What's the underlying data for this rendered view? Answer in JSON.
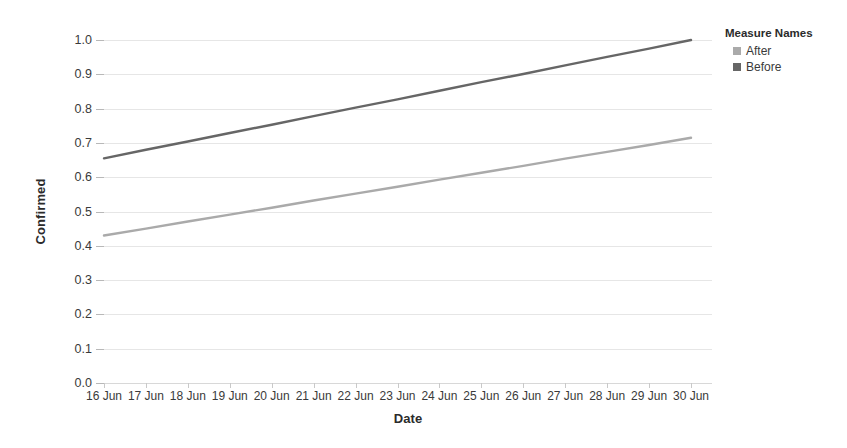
{
  "chart_data": {
    "type": "line",
    "title": "",
    "xlabel": "Date",
    "ylabel": "Confirmed",
    "x": [
      "16 Jun",
      "17 Jun",
      "18 Jun",
      "19 Jun",
      "20 Jun",
      "21 Jun",
      "22 Jun",
      "23 Jun",
      "24 Jun",
      "25 Jun",
      "26 Jun",
      "27 Jun",
      "28 Jun",
      "29 Jun",
      "30 Jun"
    ],
    "xlim": [
      "16 Jun",
      "30 Jun"
    ],
    "ylim": [
      0.0,
      1.0
    ],
    "yticks": [
      "1.0",
      "0.9",
      "0.8",
      "0.7",
      "0.6",
      "0.5",
      "0.4",
      "0.3",
      "0.2",
      "0.1",
      "0.0"
    ],
    "ytick_values": [
      1.0,
      0.9,
      0.8,
      0.7,
      0.6,
      0.5,
      0.4,
      0.3,
      0.2,
      0.1,
      0.0
    ],
    "grid": true,
    "legend_position": "right",
    "series": [
      {
        "name": "Before",
        "color": "#666666",
        "values": [
          0.655,
          0.68,
          0.704,
          0.729,
          0.753,
          0.778,
          0.803,
          0.827,
          0.852,
          0.877,
          0.901,
          0.926,
          0.951,
          0.975,
          1.0
        ]
      },
      {
        "name": "After",
        "color": "#aaaaaa",
        "values": [
          0.43,
          0.45,
          0.471,
          0.491,
          0.511,
          0.532,
          0.552,
          0.572,
          0.593,
          0.613,
          0.633,
          0.654,
          0.674,
          0.694,
          0.715
        ]
      }
    ]
  },
  "legend": {
    "title": "Measure Names",
    "items": [
      {
        "label": "After",
        "color": "#aaaaaa"
      },
      {
        "label": "Before",
        "color": "#666666"
      }
    ]
  },
  "axes": {
    "y_title": "Confirmed",
    "x_title": "Date"
  }
}
